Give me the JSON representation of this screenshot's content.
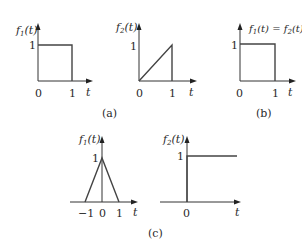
{
  "figure": {
    "panels": [
      {
        "id": "a1",
        "y_label": {
          "fn": "f",
          "sub": "1",
          "arg": "(t)"
        },
        "y_tick": "1",
        "x_ticks": [
          "0",
          "1"
        ],
        "x_label": "t",
        "signal": "rect pulse, height 1, from t=0 to t=1"
      },
      {
        "id": "a2",
        "y_label": {
          "fn": "f",
          "sub": "2",
          "arg": "(t)"
        },
        "y_tick": "1",
        "x_ticks": [
          "0",
          "1"
        ],
        "x_label": "t",
        "signal": "ramp from (0,0) to (1,1), then drop to 0"
      },
      {
        "id": "b",
        "y_label": {
          "fn1": "f",
          "sub1": "1",
          "arg1": "(t) = ",
          "fn2": "f",
          "sub2": "2",
          "arg2": "(t)"
        },
        "y_tick": "1",
        "x_ticks": [
          "0",
          "1"
        ],
        "x_label": "t",
        "signal": "rect pulse, height 1, from t=0 to t=1"
      },
      {
        "id": "c1",
        "y_label": {
          "fn": "f",
          "sub": "1",
          "arg": "(t)"
        },
        "y_tick": "1",
        "x_ticks": [
          "−1",
          "0",
          "1"
        ],
        "x_label": "t",
        "signal": "triangle, peak 1 at t=0, zero at t=-1 and t=1"
      },
      {
        "id": "c2",
        "y_label": {
          "fn": "f",
          "sub": "2",
          "arg": "(t)"
        },
        "y_tick": "1",
        "x_ticks": [
          "0"
        ],
        "x_label": "t",
        "signal": "unit step starting at t=0"
      }
    ],
    "captions": {
      "a": "(a)",
      "b": "(b)",
      "c": "(c)"
    }
  }
}
